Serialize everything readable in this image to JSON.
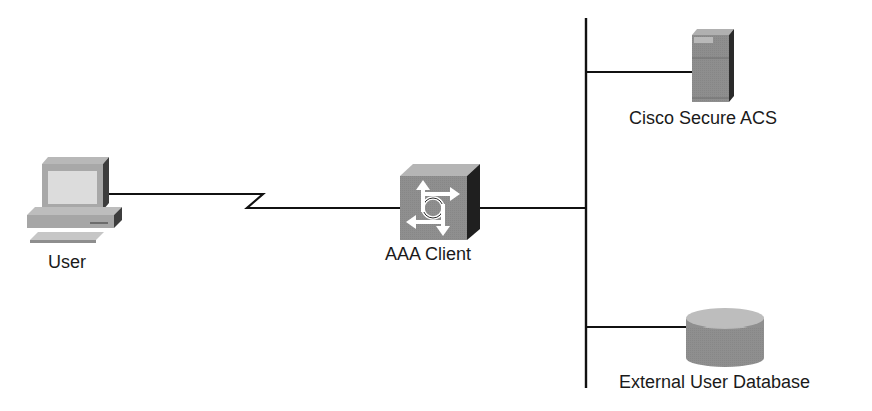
{
  "diagram": {
    "type": "network-topology",
    "nodes": [
      {
        "id": "user",
        "label": "User",
        "icon": "workstation-icon"
      },
      {
        "id": "aaa_client",
        "label": "AAA Client",
        "icon": "router-icon"
      },
      {
        "id": "acs",
        "label": "Cisco Secure ACS",
        "icon": "server-icon"
      },
      {
        "id": "ext_db",
        "label": "External User Database",
        "icon": "database-icon"
      }
    ],
    "links": [
      {
        "from": "user",
        "to": "aaa_client",
        "style": "serial-lightning"
      },
      {
        "from": "aaa_client",
        "to": "lan_bus",
        "style": "ethernet"
      },
      {
        "from": "lan_bus",
        "to": "acs",
        "style": "ethernet"
      },
      {
        "from": "lan_bus",
        "to": "ext_db",
        "style": "ethernet"
      }
    ],
    "colors": {
      "line": "#111111",
      "device_light": "#c4c4c4",
      "device_mid": "#9a9a9a",
      "device_dark": "#3a3a3a",
      "background": "#ffffff"
    }
  },
  "labels": {
    "user": "User",
    "aaa_client": "AAA Client",
    "acs": "Cisco Secure ACS",
    "ext_db": "External User Database"
  }
}
